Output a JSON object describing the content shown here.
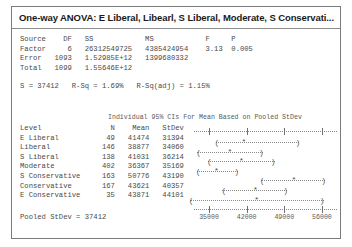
{
  "window": {
    "title": "One-way ANOVA: E Liberal, Libearl, S Liberal, Moderate, S Conservati..."
  },
  "anova_table": {
    "text": "Source    DF   SS            MS            F     P\nFactor     6   26312549725   4385424954    3.13  0.005\nError   1093   1.52985E+12   1399680332\nTotal   1099   1.55646E+12",
    "headers": [
      "Source",
      "DF",
      "SS",
      "MS",
      "F",
      "P"
    ],
    "rows": [
      {
        "source": "Factor",
        "df": "6",
        "ss": "26312549725",
        "ms": "4385424954",
        "f": "3.13",
        "p": "0.005"
      },
      {
        "source": "Error",
        "df": "1093",
        "ss": "1.52985E+12",
        "ms": "1399680332",
        "f": "",
        "p": ""
      },
      {
        "source": "Total",
        "df": "1099",
        "ss": "1.55646E+12",
        "ms": "",
        "f": "",
        "p": ""
      }
    ]
  },
  "model_summary": {
    "text": "S = 37412   R-Sq = 1.69%   R-Sq(adj) = 1.15%",
    "s": "37412",
    "r_sq": "1.69%",
    "r_sq_adj": "1.15%"
  },
  "ci_caption": "Individual 95% CIs For Mean Based on Pooled StDev",
  "levels_block": {
    "header": "Level                N    Mean   StDev",
    "text": "Level                N    Mean   StDev\nE Liberal           49   41474   31394\nLiberal            146   38877   34060\nS Liberal          138   41031   36214\nModerate           402   36367   35169\nS Conservative     163   50776   43190\nConservative       167   43621   40357\nE Conservative      35   43871   44101"
  },
  "pooled_stdev": "Pooled StDev = 37412",
  "chart_data": {
    "type": "errorbar",
    "title": "Individual 95% CIs For Mean Based on Pooled StDev",
    "xlabel": "",
    "ylabel": "",
    "xlim": [
      32200,
      58800
    ],
    "xticks": [
      35000,
      42000,
      49000,
      56000
    ],
    "xtick_labels": [
      "35000",
      "42000",
      "49000",
      "56000"
    ],
    "grid": false,
    "legend": "none",
    "categories": [
      "E Liberal",
      "Liberal",
      "S Liberal",
      "Moderate",
      "S Conservative",
      "Conservative",
      "E Conservative"
    ],
    "n": [
      49,
      146,
      138,
      402,
      163,
      167,
      35
    ],
    "means": [
      41474,
      38877,
      41031,
      36367,
      50776,
      43621,
      43871
    ],
    "stdevs": [
      31394,
      34060,
      36214,
      35169,
      43190,
      40357,
      44101
    ],
    "ci_lower": [
      36200,
      32800,
      36400,
      39500,
      44600,
      37500,
      31400
    ],
    "ci_upper": [
      51800,
      45000,
      47200,
      49400,
      50800,
      43200,
      56300
    ],
    "bars": [
      {
        "label": "E Liberal",
        "lower": 36200,
        "mean": 41474,
        "upper": 51800,
        "left_cap": "(",
        "right_cap": ")"
      },
      {
        "label": "Liberal",
        "lower": 32800,
        "mean": 38877,
        "upper": 45000,
        "left_cap": "(",
        "right_cap": ")"
      },
      {
        "label": "S Liberal",
        "lower": 34800,
        "mean": 41031,
        "upper": 47200,
        "left_cap": "(",
        "right_cap": ")"
      },
      {
        "label": "Moderate",
        "lower": 32700,
        "mean": 36367,
        "upper": 40400,
        "left_cap": "(",
        "right_cap": ")"
      },
      {
        "label": "S Conservative",
        "lower": 44600,
        "mean": 50776,
        "upper": 56600,
        "left_cap": "(",
        "right_cap": ")"
      },
      {
        "label": "Conservative",
        "lower": 37500,
        "mean": 43621,
        "upper": 49500,
        "left_cap": "(",
        "right_cap": ")"
      },
      {
        "label": "E Conservative",
        "lower": 31400,
        "mean": 43871,
        "upper": 56300,
        "left_cap": "(",
        "right_cap": ")"
      }
    ]
  }
}
